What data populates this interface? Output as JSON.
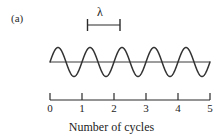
{
  "figure": {
    "panel_label": "(a)",
    "background_color": "#ffffff",
    "line_color": "#2b2b2b",
    "wave_color": "#333333"
  },
  "wavelength_marker": {
    "symbol": "λ",
    "name": "wavelength",
    "span_cycles": [
      1,
      2
    ],
    "left_x": 87,
    "right_x": 120,
    "rule_y": 25,
    "cap_top_y": 19,
    "cap_bottom_y": 31
  },
  "axis": {
    "caption": "Number of cycles",
    "tick_labels": [
      "0",
      "1",
      "2",
      "3",
      "4",
      "5"
    ],
    "tick_positions_px": [
      50,
      82,
      114,
      146,
      178,
      210
    ],
    "label_y_px": 102,
    "line_y_px": 100,
    "tick_top_y_px": 93,
    "start_x_px": 50,
    "end_x_px": 210
  },
  "chart_data": {
    "type": "line",
    "title": "",
    "subtitle": "",
    "xlabel": "Number of cycles",
    "ylabel": "",
    "xlim": [
      0,
      5
    ],
    "ylim": [
      -1,
      1
    ],
    "xticks": [
      0,
      1,
      2,
      3,
      4,
      5
    ],
    "xticklabels": [
      "0",
      "1",
      "2",
      "3",
      "4",
      "5"
    ],
    "yticks": [],
    "grid": false,
    "legend": false,
    "legend_position": "none",
    "annotations": [
      {
        "text": "λ",
        "meaning": "wavelength spans one full cycle",
        "x_start": 1.15,
        "x_end": 2.2,
        "type": "span-bracket"
      }
    ],
    "series": [
      {
        "name": "wave",
        "function": "sin(2*pi*x)",
        "amplitude": 1,
        "cycles": 5,
        "phase": 0,
        "baseline": 0,
        "x": [
          0,
          0.25,
          0.5,
          0.75,
          1,
          1.25,
          1.5,
          1.75,
          2,
          2.25,
          2.5,
          2.75,
          3,
          3.25,
          3.5,
          3.75,
          4,
          4.25,
          4.5,
          4.75,
          5
        ],
        "values": [
          0,
          1,
          0,
          -1,
          0,
          1,
          0,
          -1,
          0,
          1,
          0,
          -1,
          0,
          1,
          0,
          -1,
          0,
          1,
          0,
          -1,
          0
        ]
      },
      {
        "name": "baseline",
        "function": "0",
        "x": [
          0,
          5
        ],
        "values": [
          0,
          0
        ]
      }
    ]
  }
}
